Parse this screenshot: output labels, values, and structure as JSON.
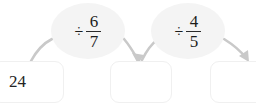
{
  "diagram": {
    "type": "function-machine-chain",
    "title": "",
    "colors": {
      "arrow": "#c9c9c9",
      "bubble_fill": "#f4f4f4",
      "box_border": "#f0f0f0",
      "text": "#1c1c1c",
      "background": "#ffffff"
    },
    "boxes": [
      {
        "name": "start",
        "value": "24",
        "empty": false
      },
      {
        "name": "middle",
        "value": "",
        "empty": true
      },
      {
        "name": "end",
        "value": "",
        "empty": true
      }
    ],
    "operations": [
      {
        "name": "divide-by-six-sevenths",
        "sign": "÷",
        "numerator": "6",
        "denominator": "7"
      },
      {
        "name": "divide-by-four-fifths",
        "sign": "÷",
        "numerator": "4",
        "denominator": "5"
      }
    ],
    "arrows": [
      {
        "name": "arrow-start-to-middle-rise",
        "has_head": false
      },
      {
        "name": "arrow-start-to-middle-fall",
        "has_head": true
      },
      {
        "name": "arrow-middle-to-end-rise",
        "has_head": false
      },
      {
        "name": "arrow-middle-to-end-fall",
        "has_head": true
      }
    ]
  }
}
